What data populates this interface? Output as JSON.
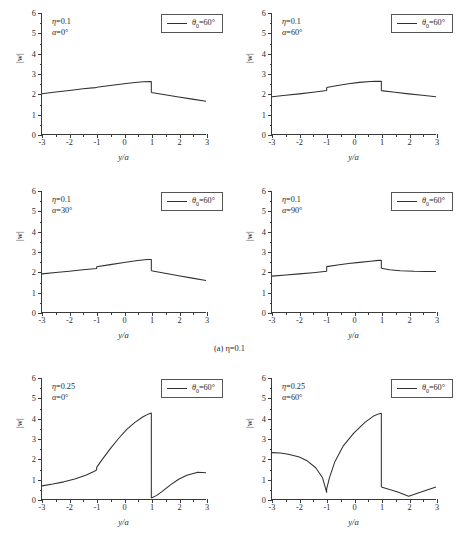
{
  "figure": {
    "caption": "(a) η=0.1",
    "axis_x_title": "y/a",
    "axis_y_title": "|w|",
    "line_color": "#303030",
    "axis_color": "#3a3a3a"
  },
  "panels": [
    {
      "id": "panel-eta0.1-alpha0",
      "eta_label": "η=0.1",
      "alpha_label": "α=0°",
      "legend_label": "θ₀=60°"
    },
    {
      "id": "panel-eta0.1-alpha60",
      "eta_label": "η=0.1",
      "alpha_label": "α=60°",
      "legend_label": "θ₀=60°"
    },
    {
      "id": "panel-eta0.1-alpha30",
      "eta_label": "η=0.1",
      "alpha_label": "α=30°",
      "legend_label": "θ₀=60°"
    },
    {
      "id": "panel-eta0.1-alpha90",
      "eta_label": "η=0.1",
      "alpha_label": "α=90°",
      "legend_label": "θ₀=60°"
    },
    {
      "id": "panel-eta0.25-alpha0",
      "eta_label": "η=0.25",
      "alpha_label": "α=0°",
      "legend_label": "θ₀=60°"
    },
    {
      "id": "panel-eta0.25-alpha60",
      "eta_label": "η=0.25",
      "alpha_label": "α=60°",
      "legend_label": "θ₀=60°"
    }
  ],
  "chart_data": [
    {
      "type": "line",
      "title": "η=0.1, α=0°",
      "xlabel": "y/a",
      "ylabel": "|w|",
      "xlim": [
        -3,
        3
      ],
      "ylim": [
        0,
        6
      ],
      "xticks": [
        -3,
        -2,
        -1,
        0,
        1,
        2,
        3
      ],
      "yticks": [
        0,
        1,
        2,
        3,
        4,
        5,
        6
      ],
      "grid": false,
      "legend": [
        "θ₀=60°"
      ],
      "legend_position": "top-right",
      "series": [
        {
          "name": "θ₀=60°",
          "segments": [
            {
              "x": [
                -3.0,
                -2.5,
                -2.0,
                -1.5,
                -1.05,
                -1.0
              ],
              "y": [
                2.0,
                2.08,
                2.16,
                2.24,
                2.3,
                2.31
              ]
            },
            {
              "x": [
                -1.0,
                -0.5,
                0.0,
                0.4,
                0.7,
                1.0
              ],
              "y": [
                2.32,
                2.41,
                2.49,
                2.55,
                2.59,
                2.6
              ]
            },
            {
              "x": [
                1.0,
                1.5,
                2.0,
                2.5,
                3.0
              ],
              "y": [
                2.06,
                1.95,
                1.84,
                1.73,
                1.62
              ]
            }
          ]
        }
      ]
    },
    {
      "type": "line",
      "title": "η=0.1, α=60°",
      "xlabel": "y/a",
      "ylabel": "|w|",
      "xlim": [
        -3,
        3
      ],
      "ylim": [
        0,
        6
      ],
      "xticks": [
        -3,
        -2,
        -1,
        0,
        1,
        2,
        3
      ],
      "yticks": [
        0,
        1,
        2,
        3,
        4,
        5,
        6
      ],
      "grid": false,
      "legend": [
        "θ₀=60°"
      ],
      "legend_position": "top-right",
      "series": [
        {
          "name": "θ₀=60°",
          "segments": [
            {
              "x": [
                -3.0,
                -2.5,
                -2.0,
                -1.5,
                -1.0
              ],
              "y": [
                1.85,
                1.92,
                1.99,
                2.07,
                2.16
              ]
            },
            {
              "x": [
                -1.0,
                -0.6,
                -0.2,
                0.2,
                0.6,
                0.8,
                1.0
              ],
              "y": [
                2.31,
                2.41,
                2.49,
                2.56,
                2.6,
                2.61,
                2.61
              ]
            },
            {
              "x": [
                1.0,
                1.5,
                2.0,
                2.5,
                3.0
              ],
              "y": [
                2.15,
                2.07,
                1.99,
                1.92,
                1.85
              ]
            }
          ]
        }
      ]
    },
    {
      "type": "line",
      "title": "η=0.1, α=30°",
      "xlabel": "y/a",
      "ylabel": "|w|",
      "xlim": [
        -3,
        3
      ],
      "ylim": [
        0,
        6
      ],
      "xticks": [
        -3,
        -2,
        -1,
        0,
        1,
        2,
        3
      ],
      "yticks": [
        0,
        1,
        2,
        3,
        4,
        5,
        6
      ],
      "grid": false,
      "legend": [
        "θ₀=60°"
      ],
      "legend_position": "top-right",
      "series": [
        {
          "name": "θ₀=60°",
          "segments": [
            {
              "x": [
                -3.0,
                -2.5,
                -2.0,
                -1.5,
                -1.0
              ],
              "y": [
                1.89,
                1.96,
                2.02,
                2.09,
                2.16
              ]
            },
            {
              "x": [
                -1.0,
                -0.5,
                0.0,
                0.5,
                0.85,
                1.0
              ],
              "y": [
                2.24,
                2.35,
                2.45,
                2.55,
                2.6,
                2.6
              ]
            },
            {
              "x": [
                1.0,
                1.5,
                2.0,
                2.5,
                3.0
              ],
              "y": [
                2.05,
                1.92,
                1.8,
                1.68,
                1.56
              ]
            }
          ]
        }
      ]
    },
    {
      "type": "line",
      "title": "η=0.1, α=90°",
      "xlabel": "y/a",
      "ylabel": "|w|",
      "xlim": [
        -3,
        3
      ],
      "ylim": [
        0,
        6
      ],
      "xticks": [
        -3,
        -2,
        -1,
        0,
        1,
        2,
        3
      ],
      "yticks": [
        0,
        1,
        2,
        3,
        4,
        5,
        6
      ],
      "grid": false,
      "legend": [
        "θ₀=60°"
      ],
      "legend_position": "top-right",
      "series": [
        {
          "name": "θ₀=60°",
          "segments": [
            {
              "x": [
                -3.0,
                -2.5,
                -2.0,
                -1.5,
                -1.0
              ],
              "y": [
                1.78,
                1.83,
                1.89,
                1.95,
                2.02
              ]
            },
            {
              "x": [
                -1.0,
                -0.6,
                -0.2,
                0.2,
                0.6,
                0.9,
                1.0
              ],
              "y": [
                2.25,
                2.33,
                2.4,
                2.46,
                2.52,
                2.56,
                2.56
              ]
            },
            {
              "x": [
                1.0,
                1.3,
                1.7,
                2.2,
                2.6,
                3.0
              ],
              "y": [
                2.17,
                2.1,
                2.05,
                2.02,
                2.01,
                2.01
              ]
            }
          ]
        }
      ]
    },
    {
      "type": "line",
      "title": "η=0.25, α=0°",
      "xlabel": "y/a",
      "ylabel": "|w|",
      "xlim": [
        -3,
        3
      ],
      "ylim": [
        0,
        6
      ],
      "xticks": [
        -3,
        -2,
        -1,
        0,
        1,
        2,
        3
      ],
      "yticks": [
        0,
        1,
        2,
        3,
        4,
        5,
        6
      ],
      "grid": false,
      "legend": [
        "θ₀=60°"
      ],
      "legend_position": "top-right",
      "series": [
        {
          "name": "θ₀=60°",
          "segments": [
            {
              "x": [
                -3.0,
                -2.6,
                -2.2,
                -1.8,
                -1.4,
                -1.1,
                -1.0
              ],
              "y": [
                0.65,
                0.74,
                0.85,
                0.99,
                1.18,
                1.36,
                1.45
              ]
            },
            {
              "x": [
                -1.0,
                -0.8,
                -0.5,
                -0.2,
                0.1,
                0.4,
                0.7,
                0.9,
                1.0
              ],
              "y": [
                1.57,
                1.95,
                2.5,
                3.0,
                3.45,
                3.8,
                4.08,
                4.22,
                4.26
              ]
            },
            {
              "x": [
                1.0,
                1.2,
                1.4,
                1.7,
                2.0,
                2.3,
                2.7,
                3.0
              ],
              "y": [
                0.05,
                0.18,
                0.38,
                0.7,
                0.98,
                1.18,
                1.33,
                1.3
              ]
            }
          ]
        }
      ]
    },
    {
      "type": "line",
      "title": "η=0.25, α=60°",
      "xlabel": "y/a",
      "ylabel": "|w|",
      "xlim": [
        -3,
        3
      ],
      "ylim": [
        0,
        6
      ],
      "xticks": [
        -3,
        -2,
        -1,
        0,
        1,
        2,
        3
      ],
      "yticks": [
        0,
        1,
        2,
        3,
        4,
        5,
        6
      ],
      "grid": false,
      "legend": [
        "θ₀=60°"
      ],
      "legend_position": "top-right",
      "series": [
        {
          "name": "θ₀=60°",
          "segments": [
            {
              "x": [
                -3.0,
                -2.7,
                -2.4,
                -2.0,
                -1.7,
                -1.4,
                -1.15,
                -1.0
              ],
              "y": [
                2.3,
                2.28,
                2.22,
                2.08,
                1.88,
                1.55,
                1.05,
                0.33
              ]
            },
            {
              "x": [
                -1.0,
                -0.9,
                -0.7,
                -0.4,
                0.0,
                0.4,
                0.7,
                0.9,
                1.0
              ],
              "y": [
                0.5,
                1.05,
                1.85,
                2.62,
                3.28,
                3.8,
                4.1,
                4.22,
                4.25
              ]
            },
            {
              "x": [
                1.0,
                1.3,
                1.6,
                2.0,
                2.4,
                2.7,
                3.0
              ],
              "y": [
                0.6,
                0.47,
                0.35,
                0.14,
                0.32,
                0.46,
                0.6
              ]
            }
          ]
        }
      ]
    }
  ]
}
